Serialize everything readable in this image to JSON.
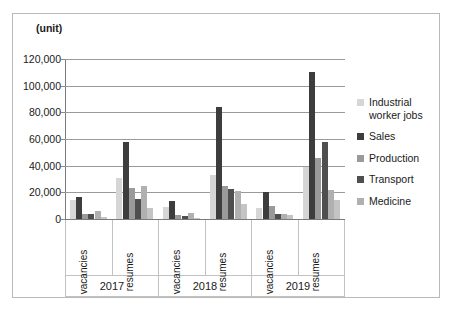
{
  "axis_title": "(unit)",
  "legend": {
    "items": [
      {
        "label": "Industrial\nworker jobs",
        "color": "#d6d6d6"
      },
      {
        "label": "Sales",
        "color": "#3d3d3d"
      },
      {
        "label": "Production",
        "color": "#9a9a9a"
      },
      {
        "label": "Transport",
        "color": "#4f4f4f"
      },
      {
        "label": "Medicine",
        "color": "#b0b0b0"
      }
    ]
  },
  "x_axis": {
    "sub_categories": [
      "vacancies",
      "resumes",
      "vacancies",
      "resumes",
      "vacancies",
      "resumes"
    ],
    "years": [
      "2017",
      "2018",
      "2019"
    ]
  },
  "y_axis": {
    "ticks": [
      "120,000",
      "100,000",
      "80,000",
      "60,000",
      "40,000",
      "20,000",
      "0"
    ],
    "values": [
      120000,
      100000,
      80000,
      60000,
      40000,
      20000,
      0
    ]
  },
  "chart_data": {
    "type": "bar",
    "title": "",
    "subtitle": "",
    "xlabel": "",
    "ylabel": "(unit)",
    "ylim": [
      0,
      120000
    ],
    "ytick_values": [
      0,
      20000,
      40000,
      60000,
      80000,
      100000,
      120000
    ],
    "grid": true,
    "legend_position": "right",
    "categories": [
      "2017 vacancies",
      "2017 resumes",
      "2018 vacancies",
      "2018 resumes",
      "2019 vacancies",
      "2019 resumes"
    ],
    "group_labels": [
      "2017",
      "2018",
      "2019"
    ],
    "series": [
      {
        "name": "Industrial worker jobs",
        "color": "#d6d6d6",
        "values": [
          14000,
          31000,
          9000,
          33000,
          8000,
          39000
        ]
      },
      {
        "name": "Sales",
        "color": "#3d3d3d",
        "values": [
          16500,
          58000,
          13500,
          84000,
          20000,
          110000
        ]
      },
      {
        "name": "Production",
        "color": "#9a9a9a",
        "values": [
          4000,
          23000,
          3000,
          25000,
          9500,
          45500
        ]
      },
      {
        "name": "Transport",
        "color": "#4f4f4f",
        "values": [
          3500,
          15000,
          2500,
          22500,
          4000,
          58000
        ]
      },
      {
        "name": "Medicine",
        "color": "#b0b0b0",
        "values": [
          6000,
          24500,
          4500,
          21000,
          3500,
          22000
        ]
      },
      {
        "name": "extra-1",
        "color": "#c4c4c4",
        "values": [
          1500,
          8000,
          1000,
          11000,
          3000,
          14000
        ]
      }
    ]
  }
}
